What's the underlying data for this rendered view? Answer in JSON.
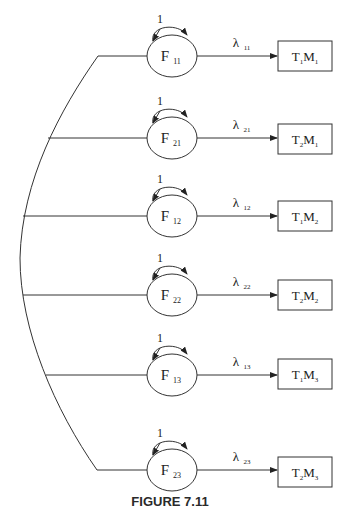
{
  "figure": {
    "caption": "FIGURE 7.11",
    "type": "path diagram (CFA model, trait-method)",
    "colors": {
      "stroke": "#333333",
      "text": "#222222",
      "background": "#ffffff"
    }
  },
  "rows": [
    {
      "factor": {
        "base": "F",
        "sub": "11"
      },
      "variance_label": "1",
      "loading": {
        "base": "λ",
        "sub": "11"
      },
      "indicator": {
        "t": "T",
        "t_sub": "1",
        "m": "M",
        "m_sub": "1"
      },
      "y": 56,
      "box_top": 41
    },
    {
      "factor": {
        "base": "F",
        "sub": "21"
      },
      "variance_label": "1",
      "loading": {
        "base": "λ",
        "sub": "21"
      },
      "indicator": {
        "t": "T",
        "t_sub": "2",
        "m": "M",
        "m_sub": "1"
      },
      "y": 138,
      "box_top": 124
    },
    {
      "factor": {
        "base": "F",
        "sub": "12"
      },
      "variance_label": "1",
      "loading": {
        "base": "λ",
        "sub": "12"
      },
      "indicator": {
        "t": "T",
        "t_sub": "1",
        "m": "M",
        "m_sub": "2"
      },
      "y": 216,
      "box_top": 201
    },
    {
      "factor": {
        "base": "F",
        "sub": "22"
      },
      "variance_label": "1",
      "loading": {
        "base": "λ",
        "sub": "22"
      },
      "indicator": {
        "t": "T",
        "t_sub": "2",
        "m": "M",
        "m_sub": "2"
      },
      "y": 295,
      "box_top": 280
    },
    {
      "factor": {
        "base": "F",
        "sub": "13"
      },
      "variance_label": "1",
      "loading": {
        "base": "λ",
        "sub": "13"
      },
      "indicator": {
        "t": "T",
        "t_sub": "1",
        "m": "M",
        "m_sub": "3"
      },
      "y": 375,
      "box_top": 359
    },
    {
      "factor": {
        "base": "F",
        "sub": "23"
      },
      "variance_label": "1",
      "loading": {
        "base": "λ",
        "sub": "23"
      },
      "indicator": {
        "t": "T",
        "t_sub": "2",
        "m": "M",
        "m_sub": "3"
      },
      "y": 470,
      "box_top": 457
    }
  ]
}
